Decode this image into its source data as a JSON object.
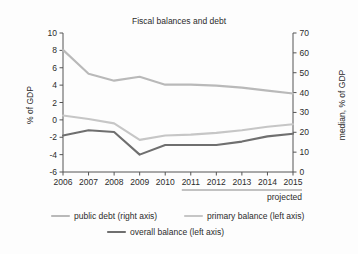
{
  "chart_data": {
    "type": "line",
    "title": "Fiscal balances and debt",
    "xlabel": "",
    "ylabel": "% of GDP",
    "y2label": "median, % of GDP",
    "x": [
      2006,
      2007,
      2008,
      2009,
      2010,
      2011,
      2012,
      2013,
      2014,
      2015
    ],
    "xtick_labels": [
      "2006",
      "2007",
      "2008",
      "2009",
      "2010",
      "2011",
      "2012",
      "2013",
      "2014",
      "2015"
    ],
    "ylim": [
      -6,
      10
    ],
    "ytick_labels": [
      "10",
      "8",
      "6",
      "4",
      "2",
      "0",
      "-2",
      "-4",
      "-6"
    ],
    "ytick_values": [
      10,
      8,
      6,
      4,
      2,
      0,
      -2,
      -4,
      -6
    ],
    "y2lim": [
      0,
      70
    ],
    "y2tick_labels": [
      "70",
      "60",
      "50",
      "40",
      "30",
      "20",
      "10",
      "0"
    ],
    "y2tick_values": [
      70,
      60,
      50,
      40,
      30,
      20,
      10,
      0
    ],
    "grid": false,
    "legend_position": "bottom",
    "series": [
      {
        "name": "public debt (right axis)",
        "axis": "right",
        "color": "#b9b9b9",
        "width": 2.1,
        "values": [
          61.5,
          49.5,
          46.0,
          48.0,
          44.0,
          44.0,
          43.5,
          42.5,
          41.0,
          39.5
        ]
      },
      {
        "name": "primary balance (left axis)",
        "axis": "left",
        "color": "#c6c6c6",
        "width": 2.1,
        "values": [
          0.5,
          0.1,
          -0.4,
          -2.3,
          -1.8,
          -1.7,
          -1.5,
          -1.2,
          -0.8,
          -0.5
        ]
      },
      {
        "name": "overall balance (left axis)",
        "axis": "left",
        "color": "#6f6f6f",
        "width": 2.1,
        "values": [
          -1.8,
          -1.2,
          -1.4,
          -4.0,
          -2.9,
          -2.9,
          -2.9,
          -2.5,
          -1.9,
          -1.6
        ]
      }
    ],
    "annotations": [
      {
        "name": "projected",
        "label": "projected",
        "from_x": 2011,
        "to_x": 2015
      }
    ]
  },
  "legend": {
    "items": [
      {
        "label": "public debt (right axis)",
        "color": "#b9b9b9"
      },
      {
        "label": "primary balance (left axis)",
        "color": "#c6c6c6"
      },
      {
        "label": "overall balance (left axis)",
        "color": "#6f6f6f"
      }
    ]
  }
}
